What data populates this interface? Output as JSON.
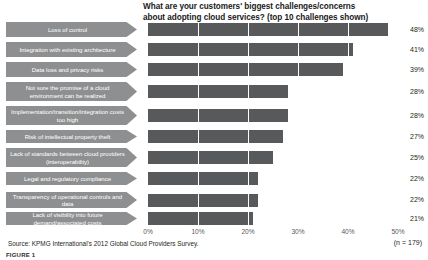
{
  "chart_data": {
    "type": "bar",
    "orientation": "horizontal",
    "title": "What are your customers' biggest challenges/concerns about adopting cloud services? (top 10 challenges shown)",
    "title_line1": "What are your customers' biggest challenges/concerns",
    "title_line2": "about adopting cloud services? (top 10 challenges shown)",
    "xlabel": "",
    "ylabel": "",
    "xlim": [
      0,
      50
    ],
    "xticks": [
      "0%",
      "10%",
      "20%",
      "30%",
      "40%",
      "50%"
    ],
    "xtick_values": [
      0,
      10,
      20,
      30,
      40,
      50
    ],
    "grid": true,
    "legend": "none",
    "categories": [
      "Loss of control",
      "Integration with existing architecture",
      "Data loss and privacy risks",
      "Not sure the promise of a cloud environment can be realized",
      "Implementation/transition/integration costs too high",
      "Risk of intellectual property theft",
      "Lack of standards between cloud providers (interoperability)",
      "Legal and regulatory compliance",
      "Transparency of operational controls and data",
      "Lack of visibility into future demand/associated costs"
    ],
    "values": [
      48,
      41,
      39,
      28,
      28,
      27,
      25,
      22,
      22,
      21
    ],
    "value_labels": [
      "48%",
      "41%",
      "39%",
      "28%",
      "28%",
      "27%",
      "25%",
      "22%",
      "22%",
      "21%"
    ],
    "bar_color": "#58595b",
    "label_tab_color": "#8e8f91",
    "gridline_color": "#ffffff"
  },
  "footer": {
    "source": "Source: KPMG International's 2012 Global Cloud Providers Survey.",
    "sample_size": "(n = 179)",
    "figure_caption": "FIGURE 1"
  }
}
